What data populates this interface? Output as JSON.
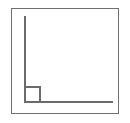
{
  "figure": {
    "title": "",
    "background_color": "#ffffff",
    "frame": {
      "label": "outer-frame",
      "stroke_color": "#6f6f6f",
      "stroke_width": 1,
      "fill_color": "#ffffff",
      "x": 11,
      "y": 8,
      "width": 108,
      "height": 106
    }
  },
  "chart_data": {
    "type": "diagram",
    "title": "",
    "subtitle": "",
    "xlabel": "",
    "ylabel": "",
    "grid": false,
    "legend": null,
    "tick_labels": {
      "x": [],
      "y": []
    },
    "annotations": [],
    "elements": [
      {
        "name": "y-axis-line",
        "shape": "line",
        "orientation": "vertical",
        "stroke_color": "#6b6b6b",
        "stroke_width": 2,
        "x1": 24,
        "y1": 16,
        "x2": 24,
        "y2": 103
      },
      {
        "name": "x-axis-line",
        "shape": "line",
        "orientation": "horizontal",
        "stroke_color": "#6b6b6b",
        "stroke_width": 2,
        "x1": 24,
        "y1": 101,
        "x2": 113,
        "y2": 101
      },
      {
        "name": "origin-square",
        "shape": "rectangle",
        "filled": false,
        "stroke_color": "#6b6b6b",
        "stroke_width": 2,
        "fill_color": "transparent",
        "x": 24,
        "y": 86,
        "width": 17,
        "height": 17
      }
    ]
  }
}
